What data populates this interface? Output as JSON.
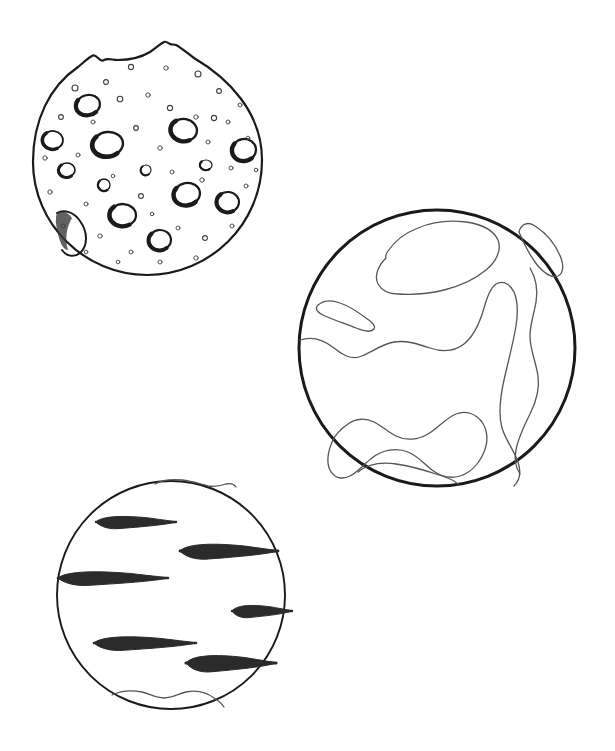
{
  "document": {
    "title": "Planets Coloring Page",
    "type": "line-art-illustration",
    "background_color": "#ffffff",
    "ink_color": "#1a1a1a",
    "detail_line_color": "#555555",
    "band_fill_color": "#2b2b2b",
    "canvas": {
      "width": 615,
      "height": 751
    }
  },
  "objects": [
    {
      "id": "cratered-moon",
      "label": "Cratered Moon",
      "shape": "circle-irregular-top",
      "center": {
        "x": 148,
        "y": 158
      },
      "radius": 115,
      "outline_width": 2.2,
      "features": "impact craters, bumpy mountainous upper rim, crescent shadow crater at lower-left limb"
    },
    {
      "id": "continent-planet",
      "label": "Earth-like Planet",
      "shape": "circle",
      "center": {
        "x": 437,
        "y": 348
      },
      "radius": 138,
      "outline_width": 3.0,
      "features": "outlined continents and landmasses, thin interior contour lines"
    },
    {
      "id": "banded-gas-giant",
      "label": "Banded Gas Giant",
      "shape": "circle",
      "center": {
        "x": 171,
        "y": 595
      },
      "radius": 114,
      "outline_width": 1.8,
      "features": "seven dark horizontal cloud bands, wavy polar caps at top and bottom"
    }
  ],
  "moon_craters": [
    {
      "cx": 88,
      "cy": 105,
      "rx": 12,
      "ry": 10,
      "rot": -12,
      "w": 2.2
    },
    {
      "cx": 53,
      "cy": 140,
      "rx": 10,
      "ry": 9,
      "rot": 8,
      "w": 1.8
    },
    {
      "cx": 108,
      "cy": 144,
      "rx": 15,
      "ry": 12,
      "rot": -6,
      "w": 2.4
    },
    {
      "cx": 184,
      "cy": 130,
      "rx": 13,
      "ry": 11,
      "rot": 10,
      "w": 2.3
    },
    {
      "cx": 244,
      "cy": 150,
      "rx": 12,
      "ry": 11,
      "rot": -8,
      "w": 2.3
    },
    {
      "cx": 123,
      "cy": 215,
      "rx": 13,
      "ry": 11,
      "rot": 4,
      "w": 2.3
    },
    {
      "cx": 187,
      "cy": 194,
      "rx": 13,
      "ry": 11,
      "rot": -10,
      "w": 2.3
    },
    {
      "cx": 228,
      "cy": 202,
      "rx": 11,
      "ry": 10,
      "rot": 6,
      "w": 2.1
    },
    {
      "cx": 160,
      "cy": 240,
      "rx": 11,
      "ry": 10,
      "rot": -4,
      "w": 2.1
    },
    {
      "cx": 67,
      "cy": 170,
      "rx": 8,
      "ry": 7,
      "rot": 0,
      "w": 1.6
    },
    {
      "cx": 104,
      "cy": 185,
      "rx": 6,
      "ry": 6,
      "rot": 0,
      "w": 1.3
    },
    {
      "cx": 206,
      "cy": 165,
      "rx": 6,
      "ry": 5,
      "rot": 0,
      "w": 1.2
    },
    {
      "cx": 146,
      "cy": 170,
      "rx": 5,
      "ry": 5,
      "rot": 0,
      "w": 1.1
    }
  ],
  "moon_small_pits": [
    {
      "cx": 75,
      "cy": 88,
      "r": 3.0
    },
    {
      "cx": 106,
      "cy": 82,
      "r": 2.4
    },
    {
      "cx": 131,
      "cy": 67,
      "r": 2.6
    },
    {
      "cx": 166,
      "cy": 68,
      "r": 2.2
    },
    {
      "cx": 198,
      "cy": 74,
      "r": 3.0
    },
    {
      "cx": 219,
      "cy": 91,
      "r": 2.4
    },
    {
      "cx": 240,
      "cy": 105,
      "r": 2.0
    },
    {
      "cx": 61,
      "cy": 117,
      "r": 2.4
    },
    {
      "cx": 93,
      "cy": 122,
      "r": 2.0
    },
    {
      "cx": 120,
      "cy": 99,
      "r": 2.8
    },
    {
      "cx": 148,
      "cy": 95,
      "r": 2.2
    },
    {
      "cx": 170,
      "cy": 108,
      "r": 2.6
    },
    {
      "cx": 196,
      "cy": 117,
      "r": 2.2
    },
    {
      "cx": 228,
      "cy": 122,
      "r": 2.0
    },
    {
      "cx": 248,
      "cy": 138,
      "r": 1.8
    },
    {
      "cx": 45,
      "cy": 158,
      "r": 2.2
    },
    {
      "cx": 78,
      "cy": 155,
      "r": 2.0
    },
    {
      "cx": 136,
      "cy": 128,
      "r": 2.4
    },
    {
      "cx": 160,
      "cy": 148,
      "r": 2.2
    },
    {
      "cx": 208,
      "cy": 142,
      "r": 2.0
    },
    {
      "cx": 256,
      "cy": 170,
      "r": 1.8
    },
    {
      "cx": 50,
      "cy": 192,
      "r": 2.2
    },
    {
      "cx": 86,
      "cy": 204,
      "r": 2.0
    },
    {
      "cx": 113,
      "cy": 176,
      "r": 1.8
    },
    {
      "cx": 141,
      "cy": 196,
      "r": 2.4
    },
    {
      "cx": 172,
      "cy": 172,
      "r": 2.0
    },
    {
      "cx": 202,
      "cy": 180,
      "r": 2.2
    },
    {
      "cx": 246,
      "cy": 186,
      "r": 2.0
    },
    {
      "cx": 63,
      "cy": 226,
      "r": 2.0
    },
    {
      "cx": 100,
      "cy": 236,
      "r": 2.2
    },
    {
      "cx": 131,
      "cy": 252,
      "r": 2.0
    },
    {
      "cx": 152,
      "cy": 214,
      "r": 1.8
    },
    {
      "cx": 178,
      "cy": 228,
      "r": 2.0
    },
    {
      "cx": 205,
      "cy": 238,
      "r": 2.4
    },
    {
      "cx": 232,
      "cy": 226,
      "r": 2.0
    },
    {
      "cx": 160,
      "cy": 262,
      "r": 2.0
    },
    {
      "cx": 196,
      "cy": 258,
      "r": 2.2
    },
    {
      "cx": 86,
      "cy": 252,
      "r": 1.8
    },
    {
      "cx": 118,
      "cy": 262,
      "r": 1.8
    },
    {
      "cx": 214,
      "cy": 118,
      "r": 2.6
    },
    {
      "cx": 231,
      "cy": 168,
      "r": 2.0
    }
  ],
  "gas_giant_bands": [
    {
      "cy": 522,
      "x1": 96,
      "x2": 176,
      "h": 9,
      "label": "band-1"
    },
    {
      "cy": 551,
      "x1": 180,
      "x2": 278,
      "h": 11,
      "label": "band-2"
    },
    {
      "cy": 578,
      "x1": 58,
      "x2": 168,
      "h": 10,
      "label": "band-3"
    },
    {
      "cy": 611,
      "x1": 232,
      "x2": 292,
      "h": 9,
      "label": "band-4"
    },
    {
      "cy": 643,
      "x1": 94,
      "x2": 196,
      "h": 10,
      "label": "band-5"
    },
    {
      "cy": 663,
      "x1": 186,
      "x2": 276,
      "h": 12,
      "label": "band-6"
    }
  ]
}
